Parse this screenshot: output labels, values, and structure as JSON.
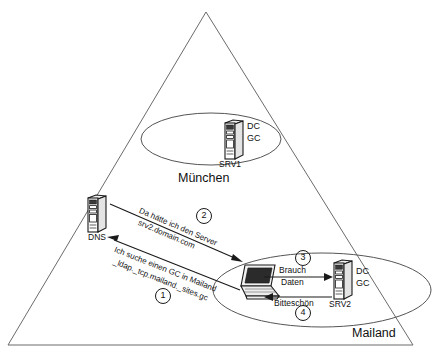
{
  "diagram": {
    "title_shape": "triangle-domain-boundary",
    "background_color": "#ffffff",
    "line_color": "#6b6b6b",
    "text_color": "#111111",
    "sites": [
      {
        "id": "muenchen",
        "label": "München",
        "server": {
          "name": "SRV1",
          "roles": [
            "DC",
            "GC"
          ],
          "icon": "server-tower-icon"
        }
      },
      {
        "id": "mailand",
        "label": "Mailand",
        "client": {
          "icon": "laptop-icon"
        },
        "server": {
          "name": "SRV2",
          "roles": [
            "DC",
            "GC"
          ],
          "icon": "server-tower-icon"
        }
      }
    ],
    "dns": {
      "label": "DNS",
      "icon": "server-tower-icon"
    },
    "steps": [
      {
        "number": "1",
        "marker": "①",
        "lines": [
          "Ich suche einen GC in Mailand",
          "_ldap._tcp.mailand._sites.gc"
        ],
        "from": "client-mailand",
        "to": "dns"
      },
      {
        "number": "2",
        "marker": "②",
        "lines": [
          "Da hätte ich den Server",
          "srv2.domain.com"
        ],
        "from": "dns",
        "to": "client-mailand"
      },
      {
        "number": "3",
        "marker": "③",
        "lines": [
          "Brauch",
          "Daten"
        ],
        "from": "client-mailand",
        "to": "srv2"
      },
      {
        "number": "4",
        "marker": "④",
        "lines": [
          "Bitteschön"
        ],
        "from": "srv2",
        "to": "client-mailand"
      }
    ]
  }
}
